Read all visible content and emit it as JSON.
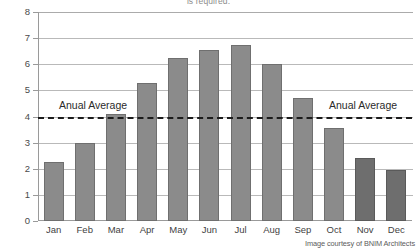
{
  "caption": {
    "cutoff_text": "is required."
  },
  "credit": {
    "text": "Image courtesy of BNIM Architects"
  },
  "annotations": {
    "avg_label_left": "Anual Average",
    "avg_label_right": "Anual Average"
  },
  "colors": {
    "bar": "#8b8b8b",
    "bar_dark": "#6e6e6e",
    "gridline": "#b9b9b9",
    "axis": "#9a9a9a",
    "average_line": "#1b1b1b",
    "text": "#3a3a3a"
  },
  "chart_data": {
    "type": "bar",
    "title": "",
    "xlabel": "",
    "ylabel": "",
    "categories": [
      "Jan",
      "Feb",
      "Mar",
      "Apr",
      "May",
      "Jun",
      "Jul",
      "Aug",
      "Sep",
      "Oct",
      "Nov",
      "Dec"
    ],
    "values": [
      2.25,
      3.0,
      4.1,
      5.3,
      6.25,
      6.55,
      6.75,
      6.0,
      4.7,
      3.55,
      2.4,
      1.95
    ],
    "ylim": [
      0,
      8
    ],
    "yticks": [
      0,
      1,
      2,
      3,
      4,
      5,
      6,
      7,
      8
    ],
    "ytick_labels": [
      "0",
      "1",
      "2",
      "3",
      "4",
      "5",
      "6",
      "7",
      "8"
    ],
    "grid": true,
    "legend": "none",
    "annotations": [
      {
        "type": "hline",
        "value": 4,
        "label": "Anual Average",
        "style": "dashed"
      }
    ],
    "series": [
      {
        "name": "Monthly value",
        "values": [
          2.25,
          3.0,
          4.1,
          5.3,
          6.25,
          6.55,
          6.75,
          6.0,
          4.7,
          3.55,
          2.4,
          1.95
        ]
      }
    ]
  }
}
